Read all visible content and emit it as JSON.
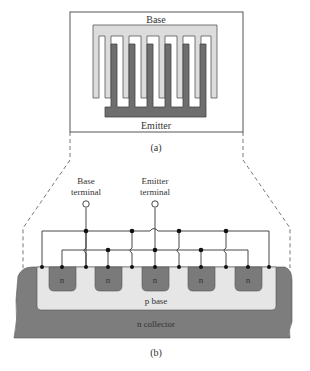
{
  "figure_a": {
    "caption": "(a)",
    "base_label": "Base",
    "emitter_label": "Emitter"
  },
  "figure_b": {
    "caption": "(b)",
    "base_terminal_line1": "Base",
    "base_terminal_line2": "terminal",
    "emitter_terminal_line1": "Emitter",
    "emitter_terminal_line2": "terminal",
    "n_region_label": "n",
    "p_base_label": "p base",
    "n_collector_label": "n collector"
  },
  "colors": {
    "base_metal": "#d8d8d8",
    "emitter_metal": "#6e6e6e",
    "collector": "#7d7d7d",
    "p_base": "#e6e6e6",
    "n_region": "#7a7a7a",
    "line": "#333333"
  }
}
